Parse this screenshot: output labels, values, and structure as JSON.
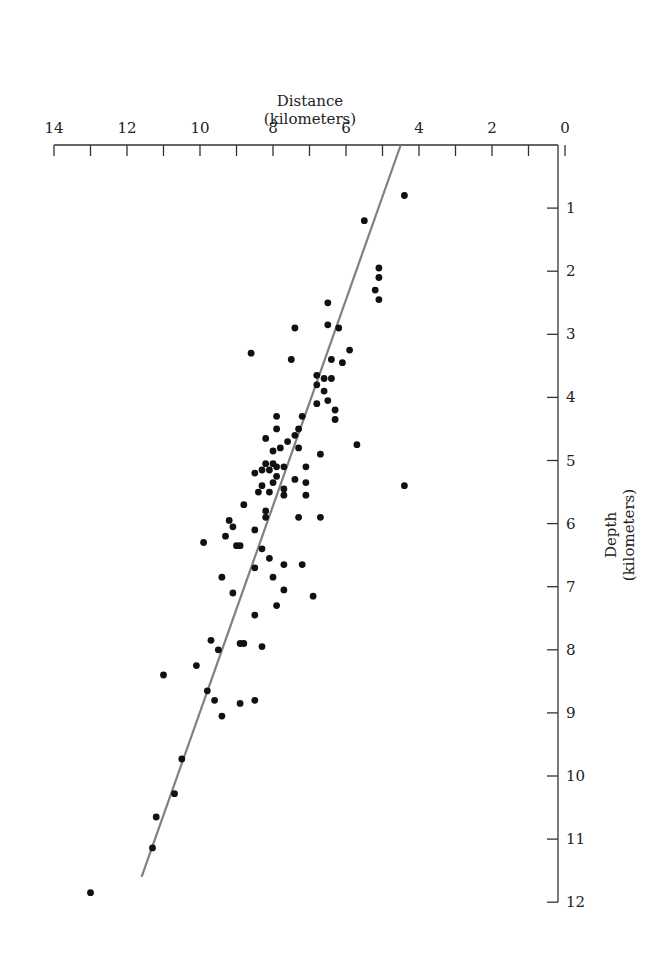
{
  "chart_data": {
    "type": "scatter",
    "title": "",
    "xlabel": "Distance (kilometers)",
    "ylabel": "Depth (kilometers)",
    "xlabel_lines": [
      "Distance",
      "(kilometers)"
    ],
    "ylabel_lines": [
      "Depth",
      "(kilometers)"
    ],
    "x_axis_position": "top",
    "y_axis_position": "right",
    "x_reversed": true,
    "y_reversed": true,
    "xlim": [
      0,
      14
    ],
    "ylim": [
      0,
      12
    ],
    "x_ticks_labeled": [
      14,
      12,
      10,
      8,
      6,
      4,
      2,
      0
    ],
    "x_ticks_minor_step": 1,
    "y_ticks": [
      1,
      2,
      3,
      4,
      5,
      6,
      7,
      8,
      9,
      10,
      11,
      12
    ],
    "grid": false,
    "legend": null,
    "fit_line": {
      "x1": 4.5,
      "y1": 0.0,
      "x2": 11.6,
      "y2": 11.6,
      "color": "#808080"
    },
    "point_color": "#111111",
    "points": [
      {
        "x": 4.4,
        "y": 0.8
      },
      {
        "x": 5.5,
        "y": 1.2
      },
      {
        "x": 5.1,
        "y": 1.95
      },
      {
        "x": 5.1,
        "y": 2.1
      },
      {
        "x": 5.2,
        "y": 2.3
      },
      {
        "x": 5.1,
        "y": 2.45
      },
      {
        "x": 6.5,
        "y": 2.5
      },
      {
        "x": 6.5,
        "y": 2.85
      },
      {
        "x": 6.2,
        "y": 2.9
      },
      {
        "x": 7.4,
        "y": 2.9
      },
      {
        "x": 8.6,
        "y": 3.3
      },
      {
        "x": 5.9,
        "y": 3.25
      },
      {
        "x": 7.5,
        "y": 3.4
      },
      {
        "x": 6.4,
        "y": 3.4
      },
      {
        "x": 6.1,
        "y": 3.45
      },
      {
        "x": 6.8,
        "y": 3.65
      },
      {
        "x": 6.8,
        "y": 3.8
      },
      {
        "x": 6.6,
        "y": 3.7
      },
      {
        "x": 6.4,
        "y": 3.7
      },
      {
        "x": 6.6,
        "y": 3.9
      },
      {
        "x": 6.8,
        "y": 4.1
      },
      {
        "x": 6.5,
        "y": 4.05
      },
      {
        "x": 6.3,
        "y": 4.2
      },
      {
        "x": 6.3,
        "y": 4.35
      },
      {
        "x": 7.9,
        "y": 4.3
      },
      {
        "x": 7.2,
        "y": 4.3
      },
      {
        "x": 7.3,
        "y": 4.5
      },
      {
        "x": 7.9,
        "y": 4.5
      },
      {
        "x": 7.4,
        "y": 4.6
      },
      {
        "x": 7.6,
        "y": 4.7
      },
      {
        "x": 8.2,
        "y": 4.65
      },
      {
        "x": 8.0,
        "y": 4.85
      },
      {
        "x": 7.8,
        "y": 4.8
      },
      {
        "x": 7.3,
        "y": 4.8
      },
      {
        "x": 6.7,
        "y": 4.9
      },
      {
        "x": 5.7,
        "y": 4.75
      },
      {
        "x": 8.2,
        "y": 5.05
      },
      {
        "x": 8.0,
        "y": 5.05
      },
      {
        "x": 8.1,
        "y": 5.15
      },
      {
        "x": 7.9,
        "y": 5.1
      },
      {
        "x": 7.7,
        "y": 5.1
      },
      {
        "x": 8.5,
        "y": 5.2
      },
      {
        "x": 8.3,
        "y": 5.15
      },
      {
        "x": 7.9,
        "y": 5.25
      },
      {
        "x": 8.0,
        "y": 5.35
      },
      {
        "x": 7.1,
        "y": 5.1
      },
      {
        "x": 4.4,
        "y": 5.4
      },
      {
        "x": 7.4,
        "y": 5.3
      },
      {
        "x": 7.1,
        "y": 5.35
      },
      {
        "x": 8.3,
        "y": 5.4
      },
      {
        "x": 8.1,
        "y": 5.5
      },
      {
        "x": 8.4,
        "y": 5.5
      },
      {
        "x": 7.7,
        "y": 5.45
      },
      {
        "x": 7.7,
        "y": 5.55
      },
      {
        "x": 7.1,
        "y": 5.55
      },
      {
        "x": 8.8,
        "y": 5.7
      },
      {
        "x": 8.2,
        "y": 5.9
      },
      {
        "x": 7.3,
        "y": 5.9
      },
      {
        "x": 6.7,
        "y": 5.9
      },
      {
        "x": 8.2,
        "y": 5.8
      },
      {
        "x": 9.2,
        "y": 5.95
      },
      {
        "x": 9.1,
        "y": 6.05
      },
      {
        "x": 8.5,
        "y": 6.1
      },
      {
        "x": 9.9,
        "y": 6.3
      },
      {
        "x": 9.3,
        "y": 6.2
      },
      {
        "x": 9.0,
        "y": 6.35
      },
      {
        "x": 8.9,
        "y": 6.35
      },
      {
        "x": 8.3,
        "y": 6.4
      },
      {
        "x": 8.1,
        "y": 6.55
      },
      {
        "x": 7.7,
        "y": 6.65
      },
      {
        "x": 8.5,
        "y": 6.7
      },
      {
        "x": 7.2,
        "y": 6.65
      },
      {
        "x": 9.4,
        "y": 6.85
      },
      {
        "x": 8.0,
        "y": 6.85
      },
      {
        "x": 7.7,
        "y": 7.05
      },
      {
        "x": 9.1,
        "y": 7.1
      },
      {
        "x": 6.9,
        "y": 7.15
      },
      {
        "x": 7.9,
        "y": 7.3
      },
      {
        "x": 8.5,
        "y": 7.45
      },
      {
        "x": 9.7,
        "y": 7.85
      },
      {
        "x": 9.5,
        "y": 8.0
      },
      {
        "x": 8.9,
        "y": 7.9
      },
      {
        "x": 8.8,
        "y": 7.9
      },
      {
        "x": 8.3,
        "y": 7.95
      },
      {
        "x": 10.1,
        "y": 8.25
      },
      {
        "x": 11.0,
        "y": 8.4
      },
      {
        "x": 9.8,
        "y": 8.65
      },
      {
        "x": 9.6,
        "y": 8.8
      },
      {
        "x": 8.9,
        "y": 8.85
      },
      {
        "x": 8.5,
        "y": 8.8
      },
      {
        "x": 9.4,
        "y": 9.05
      },
      {
        "x": 10.5,
        "y": 9.73
      },
      {
        "x": 10.7,
        "y": 10.28
      },
      {
        "x": 11.2,
        "y": 10.65
      },
      {
        "x": 11.3,
        "y": 11.14
      },
      {
        "x": 13.0,
        "y": 11.85
      }
    ]
  }
}
